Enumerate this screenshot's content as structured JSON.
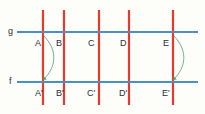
{
  "figure": {
    "type": "geometry-diagram",
    "canvas": {
      "width": 205,
      "height": 114
    },
    "background_color": "#fdfdfa"
  },
  "colors": {
    "background": "#fdfdfa",
    "horizontal_line": "#4a90c8",
    "vertical_line": "#e8392e",
    "arrow": "#4a9a72",
    "label_text": "#23303c"
  },
  "horizontal_lines": [
    {
      "name": "g",
      "label": "g",
      "label_x": 8,
      "label_y": 27,
      "y": 32,
      "x_start": 17,
      "x_end": 198,
      "stroke_width": 1.8
    },
    {
      "name": "f",
      "label": "f",
      "label_x": 9,
      "label_y": 77,
      "y": 82,
      "x_start": 17,
      "x_end": 198,
      "stroke_width": 1.8
    }
  ],
  "vertical_lines": [
    {
      "name": "transversal-1",
      "x": 43,
      "y_start": 10,
      "y_end": 105,
      "stroke_width": 2.2
    },
    {
      "name": "transversal-2",
      "x": 64,
      "y_start": 10,
      "y_end": 105,
      "stroke_width": 2.2
    },
    {
      "name": "transversal-3",
      "x": 99,
      "y_start": 10,
      "y_end": 105,
      "stroke_width": 2.2
    },
    {
      "name": "transversal-4",
      "x": 129,
      "y_start": 10,
      "y_end": 105,
      "stroke_width": 2.2
    },
    {
      "name": "transversal-5",
      "x": 173,
      "y_start": 10,
      "y_end": 105,
      "stroke_width": 2.2
    }
  ],
  "upper_points": [
    {
      "label": "A",
      "x": 35,
      "y": 39
    },
    {
      "label": "B",
      "x": 56,
      "y": 39
    },
    {
      "label": "C",
      "x": 88,
      "y": 39
    },
    {
      "label": "D",
      "x": 120,
      "y": 39
    },
    {
      "label": "E",
      "x": 163,
      "y": 39
    }
  ],
  "lower_points": [
    {
      "label": "A'",
      "x": 35,
      "y": 89
    },
    {
      "label": "B'",
      "x": 56,
      "y": 89
    },
    {
      "label": "C'",
      "x": 87,
      "y": 89
    },
    {
      "label": "D'",
      "x": 119,
      "y": 89
    },
    {
      "label": "E'",
      "x": 162,
      "y": 89
    }
  ],
  "arrows": [
    {
      "name": "arrow-a-to-a-prime",
      "from_label": "A",
      "to_label": "A'",
      "path": "M 44 36 C 59 52, 55 68, 44 79",
      "arrowhead_x": 44,
      "arrowhead_y": 80
    },
    {
      "name": "arrow-e-to-e-prime",
      "from_label": "E",
      "to_label": "E'",
      "path": "M 174 36 C 189 52, 185 68, 174 79",
      "arrowhead_x": 174,
      "arrowhead_y": 80
    }
  ]
}
